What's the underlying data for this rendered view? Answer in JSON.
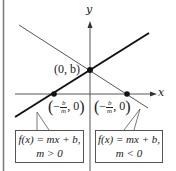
{
  "diagram": {
    "axes": {
      "x_label": "x",
      "y_label": "y"
    },
    "points": {
      "y_intercept": "(0, b)",
      "x_intercept_left": {
        "minus": "−",
        "num": "b",
        "den": "m",
        "suffix": ", 0"
      },
      "x_intercept_right": {
        "minus": "−",
        "num": "b",
        "den": "m",
        "suffix": ", 0"
      }
    },
    "callouts": {
      "positive": {
        "line1": "f(x) = mx + b,",
        "line2": "m > 0"
      },
      "negative": {
        "line1": "f(x) = mx + b,",
        "line2": "m < 0"
      }
    },
    "colors": {
      "line_positive": "#111111",
      "line_negative": "#555555",
      "axis": "#444444",
      "frame": "#777777"
    }
  }
}
